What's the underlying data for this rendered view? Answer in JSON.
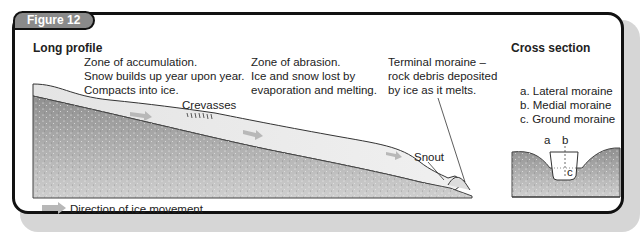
{
  "figure": {
    "badge": "Figure 12"
  },
  "long_profile": {
    "title": "Long profile",
    "zones": [
      {
        "lines": [
          "Zone of accumulation.",
          "Snow builds up year upon year.",
          "Compacts into ice."
        ]
      },
      {
        "lines": [
          "Zone of abrasion.",
          "Ice and snow lost by",
          "evaporation and melting."
        ]
      },
      {
        "lines": [
          "Terminal moraine –",
          "rock debris deposited",
          "by ice as it melts."
        ]
      }
    ],
    "labels": {
      "crevasses": "Crevasses",
      "snout": "Snout"
    }
  },
  "cross_section": {
    "title": "Cross section",
    "legend": [
      "a. Lateral moraine",
      "b. Medial moraine",
      "c. Ground moraine"
    ],
    "markers": {
      "a": "a",
      "b": "b",
      "c": "c"
    }
  },
  "key": {
    "arrow_label": "Direction of ice movement",
    "arrow_icon": "right-arrow-icon"
  },
  "colors": {
    "frame": "#111111",
    "badge": "#8a8a8a",
    "shadow": "#d6d6d6",
    "ice": "#ededed",
    "rock": "#a8a8a8",
    "arrow": "#b5b5b5"
  }
}
